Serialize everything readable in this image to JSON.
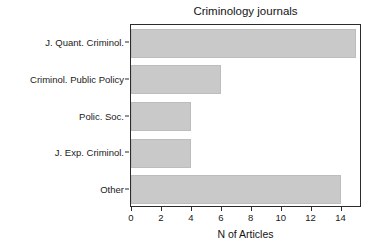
{
  "chart_data": {
    "type": "bar",
    "orientation": "horizontal",
    "title": "Criminology journals",
    "xlabel": "N of Articles",
    "ylabel": "",
    "categories": [
      "J. Quant. Criminol.",
      "Criminol. Public Policy",
      "Polic. Soc.",
      "J. Exp. Criminol.",
      "Other"
    ],
    "values": [
      15,
      6,
      4,
      4,
      14
    ],
    "xlim": [
      0,
      15.3
    ],
    "xticks": [
      0,
      2,
      4,
      6,
      8,
      10,
      12,
      14
    ],
    "xtick_labels": [
      "0",
      "2",
      "4",
      "6",
      "8",
      "10",
      "12",
      "14"
    ],
    "grid": false,
    "legend": false,
    "bar_color": "#c9c9c9",
    "bar_border_color": "#bdbdbd",
    "axis_color": "#2b2b2b",
    "text_color": "#1a1a1a",
    "background": "#ffffff"
  }
}
